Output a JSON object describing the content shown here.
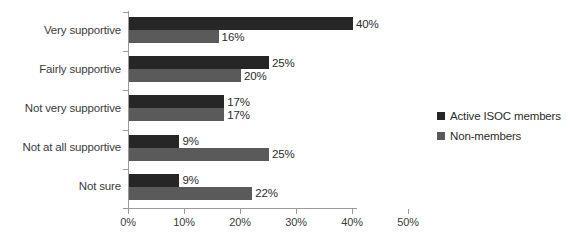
{
  "chart_data": {
    "type": "bar",
    "orientation": "horizontal",
    "title": "",
    "xlabel": "",
    "ylabel": "",
    "categories": [
      "Very supportive",
      "Fairly supportive",
      "Not very supportive",
      "Not at all supportive",
      "Not sure"
    ],
    "series": [
      {
        "name": "Active ISOC members",
        "color": "#262626",
        "values": [
          40,
          25,
          17,
          9,
          9
        ],
        "value_labels": [
          "40%",
          "25%",
          "17%",
          "9%",
          "9%"
        ]
      },
      {
        "name": "Non-members",
        "color": "#5a5a5a",
        "values": [
          16,
          20,
          17,
          25,
          22
        ],
        "value_labels": [
          "16%",
          "20%",
          "17%",
          "25%",
          "22%"
        ]
      }
    ],
    "xlim": [
      0,
      50
    ],
    "xticks": [
      0,
      10,
      20,
      30,
      40,
      50
    ],
    "xtick_labels": [
      "0%",
      "10%",
      "20%",
      "30%",
      "40%",
      "50%"
    ],
    "grid": false,
    "legend_position": "right"
  },
  "legend": {
    "entries": [
      {
        "label": "Active ISOC members"
      },
      {
        "label": "Non-members"
      }
    ]
  }
}
